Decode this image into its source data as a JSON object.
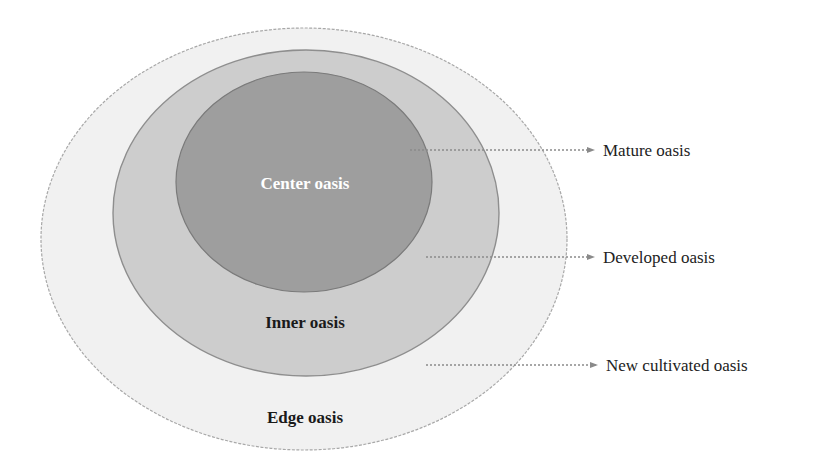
{
  "diagram": {
    "type": "concentric-zones",
    "zones": [
      {
        "id": "edge",
        "label": "Edge oasis",
        "fill": "#f1f1f1",
        "stroke": "#a8a8a8",
        "text_color": "#1a1a1a"
      },
      {
        "id": "inner",
        "label": "Inner oasis",
        "fill": "#cdcdcd",
        "stroke": "#8e8e8e",
        "text_color": "#1a1a1a"
      },
      {
        "id": "center",
        "label": "Center oasis",
        "fill": "#9e9e9e",
        "stroke": "#7a7a7a",
        "text_color": "#ffffff"
      }
    ],
    "callouts": [
      {
        "label": "Mature oasis",
        "points_to": "center"
      },
      {
        "label": "Developed oasis",
        "points_to": "inner"
      },
      {
        "label": "New cultivated oasis",
        "points_to": "edge"
      }
    ],
    "arrow_color": "#8a8a8a"
  }
}
